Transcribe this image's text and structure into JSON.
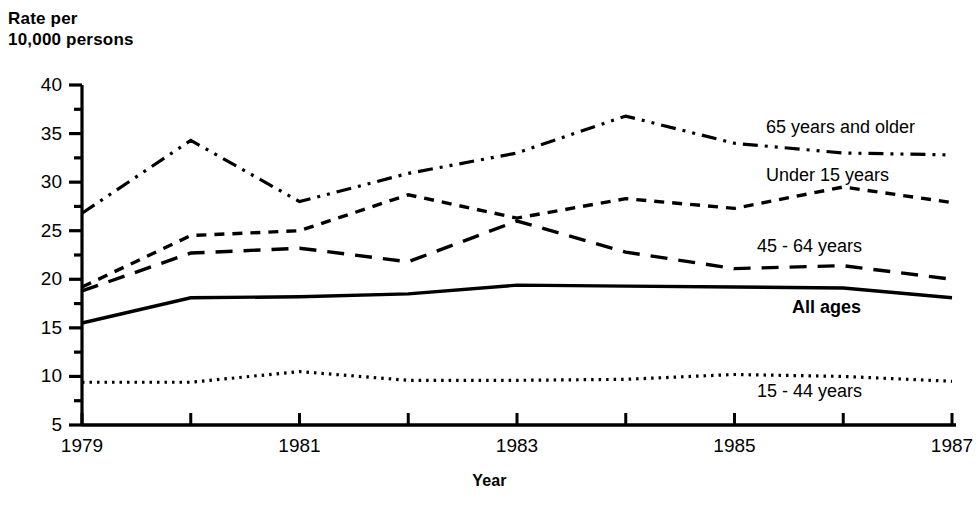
{
  "chart_data": {
    "type": "line",
    "title": "",
    "xlabel": "Year",
    "ylabel": "Rate per\n10,000 persons",
    "x": [
      1979,
      1980,
      1981,
      1982,
      1983,
      1984,
      1985,
      1986,
      1987
    ],
    "xlim": [
      1979,
      1987
    ],
    "ylim": [
      5,
      40
    ],
    "ytick_labels": [
      "40",
      "35",
      "30",
      "25",
      "20",
      "15",
      "10",
      "5"
    ],
    "ytick_values": [
      40,
      35,
      30,
      25,
      20,
      15,
      10,
      5
    ],
    "yminor_values": [
      37.5,
      32.5,
      27.5,
      22.5,
      17.5,
      12.5,
      7.5
    ],
    "xtick_values": [
      1979,
      1980,
      1981,
      1982,
      1983,
      1984,
      1985,
      1986,
      1987
    ],
    "xtick_labels": [
      "1979",
      "",
      "1981",
      "",
      "1983",
      "",
      "1985",
      "",
      "1987"
    ],
    "grid": false,
    "legend_position": "inline-right",
    "series": [
      {
        "name": "65 years and older",
        "label": "65 years and older",
        "style": "dash-dot-dot",
        "bold_label": false,
        "values": [
          26.8,
          34.3,
          28.0,
          30.9,
          33.0,
          36.8,
          34.0,
          33.0,
          32.8
        ]
      },
      {
        "name": "Under 15 years",
        "label": "Under 15 years",
        "style": "dashed-short",
        "bold_label": false,
        "values": [
          19.2,
          24.5,
          25.0,
          28.7,
          26.3,
          28.3,
          27.3,
          29.5,
          27.9
        ]
      },
      {
        "name": "45 - 64 years",
        "label": "45 - 64 years",
        "style": "dashed-long",
        "bold_label": false,
        "values": [
          18.8,
          22.7,
          23.2,
          21.8,
          26.0,
          22.8,
          21.1,
          21.4,
          20.0
        ]
      },
      {
        "name": "All ages",
        "label": "All ages",
        "style": "solid",
        "bold_label": true,
        "values": [
          15.5,
          18.1,
          18.2,
          18.5,
          19.4,
          19.3,
          19.2,
          19.1,
          18.1
        ]
      },
      {
        "name": "15 - 44 years",
        "label": "15 - 44 years",
        "style": "dotted",
        "bold_label": false,
        "values": [
          9.4,
          9.4,
          10.5,
          9.6,
          9.6,
          9.7,
          10.2,
          10.0,
          9.5
        ]
      }
    ]
  },
  "labels": {
    "y_axis_title": "Rate per\n10,000 persons",
    "x_axis_title": "Year"
  }
}
